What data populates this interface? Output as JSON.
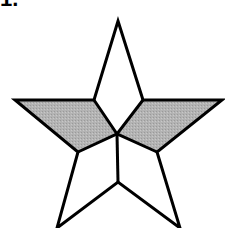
{
  "problem": {
    "label": "1."
  },
  "figure": {
    "stroke_color": "#000000",
    "shade_color": "#b3b3b3",
    "background": "#ffffff",
    "points": {
      "top": [
        118,
        21
      ],
      "left_tip": [
        15,
        100
      ],
      "right_tip": [
        222,
        100
      ],
      "inner_upper_left": [
        94,
        100
      ],
      "inner_upper_right": [
        143,
        100
      ],
      "center": [
        117,
        134
      ],
      "inner_lower_left": [
        78,
        152
      ],
      "inner_lower_right": [
        157,
        152
      ],
      "bottom_center": [
        118,
        182
      ],
      "bottom_left_tip": [
        57,
        228
      ],
      "bottom_right_tip": [
        180,
        228
      ]
    },
    "shaded_regions": [
      "left-arm",
      "right-arm"
    ]
  }
}
